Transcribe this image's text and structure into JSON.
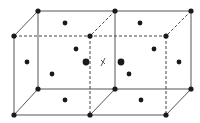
{
  "diagram": {
    "colors": {
      "edge": "#555555",
      "atom": "#1a1a1a",
      "background": "#ffffff"
    },
    "vertices": {
      "back_top": [
        [
          38,
          11
        ],
        [
          115,
          11
        ],
        [
          191,
          11
        ]
      ],
      "back_bottom": [
        [
          38,
          89
        ],
        [
          115,
          89
        ],
        [
          191,
          89
        ]
      ],
      "front_top": [
        [
          14,
          36
        ],
        [
          90,
          36
        ],
        [
          166,
          36
        ]
      ],
      "front_bottom": [
        [
          14,
          115
        ],
        [
          90,
          115
        ],
        [
          166,
          115
        ]
      ]
    },
    "solid_edges": [
      [
        38,
        11,
        191,
        11
      ],
      [
        14,
        36,
        14,
        115
      ],
      [
        14,
        115,
        166,
        115
      ],
      [
        38,
        11,
        38,
        89
      ],
      [
        115,
        11,
        115,
        89
      ],
      [
        191,
        11,
        191,
        89
      ],
      [
        38,
        89,
        191,
        89
      ],
      [
        38,
        11,
        14,
        36
      ],
      [
        38,
        89,
        14,
        115
      ],
      [
        115,
        89,
        90,
        115
      ],
      [
        191,
        89,
        166,
        115
      ]
    ],
    "dashed_edges": [
      [
        14,
        36,
        166,
        36
      ],
      [
        90,
        36,
        90,
        115
      ],
      [
        166,
        36,
        166,
        115
      ],
      [
        115,
        11,
        90,
        36
      ],
      [
        191,
        11,
        166,
        36
      ]
    ],
    "corner_atoms": [
      [
        38,
        11
      ],
      [
        115,
        11
      ],
      [
        191,
        11
      ],
      [
        14,
        36
      ],
      [
        90,
        36
      ],
      [
        166,
        36
      ],
      [
        38,
        89
      ],
      [
        115,
        89
      ],
      [
        191,
        89
      ],
      [
        14,
        115
      ],
      [
        90,
        115
      ],
      [
        166,
        115
      ]
    ],
    "face_center_atoms": [
      {
        "x": 65,
        "y": 23,
        "r": 2.4
      },
      {
        "x": 140,
        "y": 23,
        "r": 2.4
      },
      {
        "x": 65,
        "y": 100,
        "r": 2.4
      },
      {
        "x": 141,
        "y": 100,
        "r": 2.4
      },
      {
        "x": 27,
        "y": 62,
        "r": 2.4
      },
      {
        "x": 179,
        "y": 62,
        "r": 2.4
      },
      {
        "x": 76,
        "y": 49,
        "r": 2.4
      },
      {
        "x": 52,
        "y": 74,
        "r": 2.4
      },
      {
        "x": 154,
        "y": 49,
        "r": 2.4
      },
      {
        "x": 129,
        "y": 74,
        "r": 2.4
      },
      {
        "x": 86,
        "y": 62,
        "r": 3.4
      },
      {
        "x": 121,
        "y": 62,
        "r": 3.4
      }
    ],
    "marker": {
      "label": "x",
      "x": 103,
      "y": 62
    }
  }
}
